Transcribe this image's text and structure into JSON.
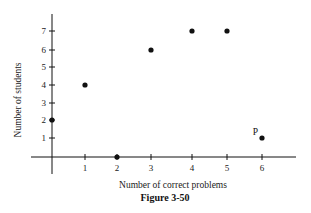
{
  "chart_data": {
    "type": "scatter",
    "title": "",
    "caption": "Figure 3-50",
    "xlabel": "Number of correct problems",
    "ylabel": "Number of students",
    "x_ticks": [
      1,
      2,
      3,
      4,
      5,
      6
    ],
    "y_ticks": [
      1,
      2,
      3,
      4,
      5,
      6,
      7
    ],
    "xlim": [
      0,
      6.8
    ],
    "ylim": [
      0,
      8
    ],
    "grid": false,
    "legend": null,
    "points": [
      {
        "x": 0,
        "y": 2,
        "label": ""
      },
      {
        "x": 1,
        "y": 4,
        "label": ""
      },
      {
        "x": 2,
        "y": 0,
        "label": ""
      },
      {
        "x": 3,
        "y": 6,
        "label": ""
      },
      {
        "x": 4,
        "y": 7,
        "label": ""
      },
      {
        "x": 5,
        "y": 7,
        "label": ""
      },
      {
        "x": 6,
        "y": 1,
        "label": "P"
      }
    ],
    "annotations": [
      {
        "text": "P",
        "x": 6,
        "y": 1
      }
    ]
  },
  "colors": {
    "ink": "#111111",
    "background": "#ffffff"
  }
}
